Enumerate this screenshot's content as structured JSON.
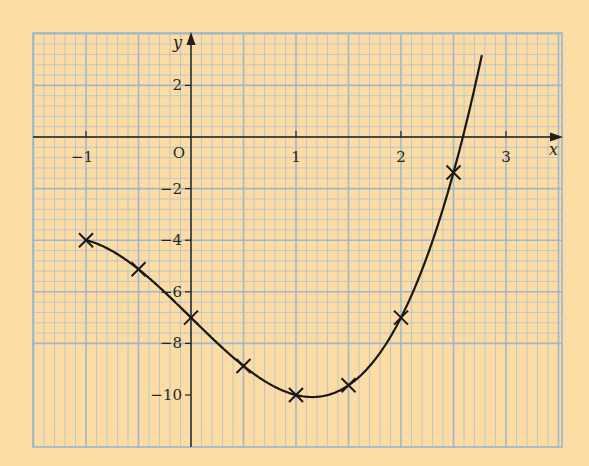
{
  "chart_data": {
    "type": "line",
    "title": "",
    "xlabel": "x",
    "ylabel": "y",
    "origin_label": "O",
    "function": "y = x^3 - 4x - 7",
    "xlim": [
      -1.5,
      3.5
    ],
    "ylim": [
      -12,
      4
    ],
    "x_ticks": [
      -1,
      1,
      2,
      3
    ],
    "x_tick_labels": [
      "−1",
      "1",
      "2",
      "3"
    ],
    "y_ticks": [
      2,
      -2,
      -4,
      -6,
      -8,
      -10
    ],
    "y_tick_labels": [
      "2",
      "−2",
      "−4",
      "−6",
      "−8",
      "−10"
    ],
    "grid": true,
    "grid_minor_x": 0.1,
    "grid_minor_y": 0.4,
    "series": [
      {
        "name": "plotted points",
        "marker": "x",
        "x": [
          -1,
          -0.5,
          0,
          0.5,
          1,
          1.5,
          2,
          2.5
        ],
        "y": [
          -4,
          -5.125,
          -7,
          -8.875,
          -10,
          -9.625,
          -7,
          -1.375
        ]
      }
    ],
    "curve_range": [
      -1,
      2.77
    ]
  },
  "colors": {
    "background": "#fcdca5",
    "grid_minor": "#a9bfcf",
    "grid_major": "#9db6cb",
    "axis": "#231f1c",
    "curve": "#1a1614"
  }
}
